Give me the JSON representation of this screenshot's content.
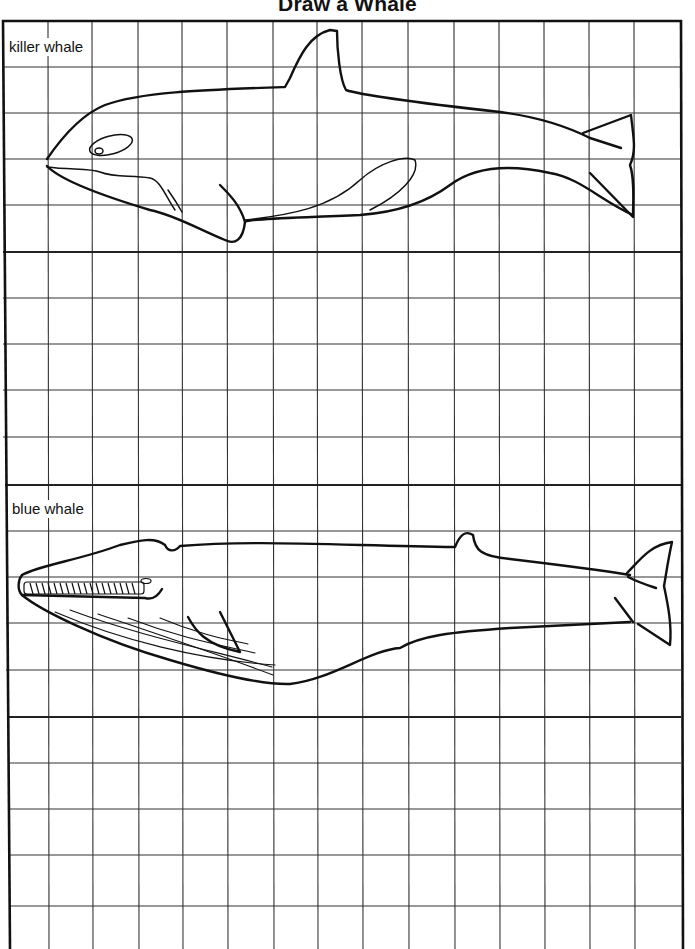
{
  "document": {
    "title": "Draw a Whale",
    "sections": [
      {
        "id": "killer-whale",
        "label": "killer whale",
        "grid_rows": 5,
        "grid_cols": 15
      },
      {
        "id": "killer-whale-practice",
        "label": "",
        "grid_rows": 5,
        "grid_cols": 15
      },
      {
        "id": "blue-whale",
        "label": "blue whale",
        "grid_rows": 5,
        "grid_cols": 15
      },
      {
        "id": "blue-whale-practice",
        "label": "",
        "grid_rows": 5,
        "grid_cols": 15
      }
    ],
    "colors": {
      "ink": "#111111",
      "paper": "#ffffff",
      "grid": "#333333"
    }
  }
}
